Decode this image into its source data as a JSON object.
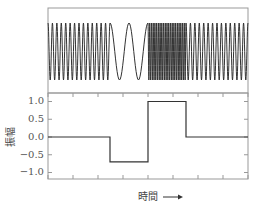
{
  "chart_data": [
    {
      "type": "line",
      "title": "",
      "description": "Frequency-modulated sinusoid: medium frequency, then low frequency, then high frequency, then medium frequency again",
      "x_range": [
        0,
        8
      ],
      "segments": [
        {
          "x_start": 0.0,
          "x_end": 2.48,
          "cycles": 14,
          "label": "medium frequency"
        },
        {
          "x_start": 2.48,
          "x_end": 4.0,
          "cycles": 2,
          "label": "low frequency"
        },
        {
          "x_start": 4.0,
          "x_end": 5.52,
          "cycles": 22,
          "label": "high frequency"
        },
        {
          "x_start": 5.52,
          "x_end": 8.0,
          "cycles": 14,
          "label": "medium frequency"
        }
      ],
      "amplitude": 1.0,
      "xlabel": "",
      "ylabel": "",
      "grid": false,
      "y_ticks": []
    },
    {
      "type": "line",
      "title": "",
      "xlabel": "時間 ⟶",
      "ylabel": "振幅",
      "ylim": [
        -1.2,
        1.2
      ],
      "y_ticks": [
        1.0,
        0.5,
        0.0,
        -0.5,
        -1.0
      ],
      "y_tick_labels": [
        "1.0",
        "0.5",
        "0.0",
        "−0.5",
        "−1.0"
      ],
      "x_ticks": [
        0,
        1,
        2,
        3,
        4,
        5,
        6,
        7,
        8
      ],
      "x_tick_labels": [],
      "step_points": [
        {
          "x": 0.0,
          "y": 0.0
        },
        {
          "x": 2.48,
          "y": 0.0
        },
        {
          "x": 2.48,
          "y": -0.7
        },
        {
          "x": 4.0,
          "y": -0.7
        },
        {
          "x": 4.0,
          "y": 1.0
        },
        {
          "x": 5.52,
          "y": 1.0
        },
        {
          "x": 5.52,
          "y": 0.0
        },
        {
          "x": 8.0,
          "y": 0.0
        }
      ],
      "grid": false,
      "legend": null
    }
  ],
  "labels": {
    "y_axis": "振幅",
    "x_axis": "時間",
    "x_arrow": "⟶",
    "y_ticks": [
      "1.0",
      "0.5",
      "0.0",
      "−0.5",
      "−1.0"
    ]
  },
  "colors": {
    "line": "#333333",
    "frame": "#888888",
    "text": "#555555"
  }
}
